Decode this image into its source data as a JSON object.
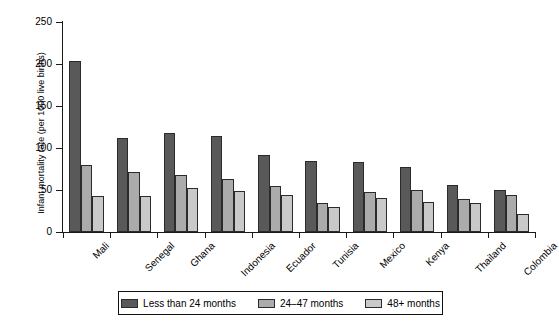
{
  "chart_data": {
    "type": "bar",
    "title": "",
    "xlabel": "",
    "ylabel": "Infant mortality rate (per 1000 live births)",
    "ylim": [
      0,
      250
    ],
    "yticks": [
      0,
      50,
      100,
      150,
      200,
      250
    ],
    "grid": false,
    "legend_position": "bottom",
    "categories": [
      "Mali",
      "Senegal",
      "Ghana",
      "Indonesia",
      "Ecuador",
      "Tunisia",
      "Mexico",
      "Kenya",
      "Thailand",
      "Colombia"
    ],
    "series": [
      {
        "name": "Less than 24 months",
        "color": "#595959",
        "values": [
          203,
          112,
          118,
          114,
          92,
          84,
          83,
          77,
          56,
          50
        ]
      },
      {
        "name": "24–47 months",
        "color": "#ababab",
        "values": [
          80,
          71,
          68,
          63,
          55,
          34,
          48,
          50,
          39,
          44
        ]
      },
      {
        "name": "48+ months",
        "color": "#c9c9c9",
        "values": [
          43,
          43,
          52,
          49,
          44,
          30,
          40,
          36,
          35,
          21
        ]
      }
    ]
  },
  "legend": {
    "items": [
      {
        "label": "Less than 24 months",
        "color": "#595959"
      },
      {
        "label": "24–47 months",
        "color": "#ababab"
      },
      {
        "label": "48+ months",
        "color": "#c9c9c9"
      }
    ]
  },
  "axes": {
    "y_title": "Infant mortality rate (per 1000 live births)",
    "y_tick_labels": [
      "250",
      "200",
      "150",
      "100",
      "50",
      "0"
    ]
  }
}
